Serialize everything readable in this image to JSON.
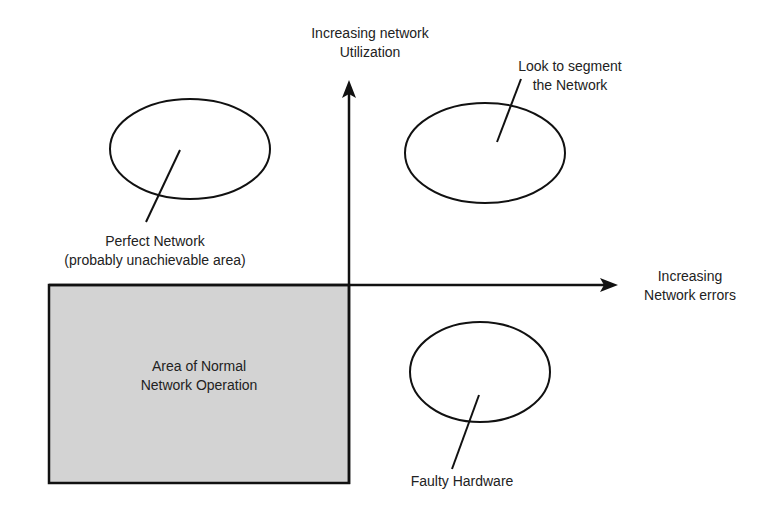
{
  "diagram": {
    "axes": {
      "y_label_line1": "Increasing network",
      "y_label_line2": "Utilization",
      "x_label_line1": "Increasing",
      "x_label_line2": "Network errors"
    },
    "regions": {
      "normal_area_line1": "Area of Normal",
      "normal_area_line2": "Network Operation",
      "normal_area_fill": "#d3d3d3"
    },
    "callouts": {
      "perfect_line1": "Perfect Network",
      "perfect_line2": "(probably unachievable area)",
      "segment_line1": "Look to segment",
      "segment_line2": "the Network",
      "faulty": "Faulty Hardware"
    },
    "colors": {
      "stroke": "#111111",
      "text": "#222222",
      "background": "#ffffff"
    }
  }
}
